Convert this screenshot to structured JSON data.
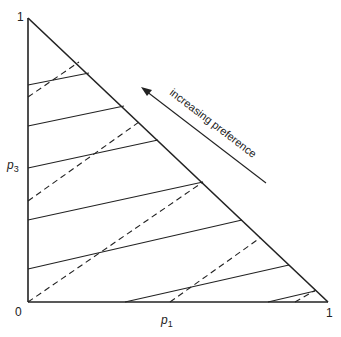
{
  "diagram": {
    "type": "probability-triangle",
    "vertices": {
      "top_label": "1",
      "origin_label": "0",
      "right_label": "1"
    },
    "axes": {
      "x_label": "p",
      "x_subscript": "1",
      "y_label": "p",
      "y_subscript": "3"
    },
    "annotation": "increasing preference",
    "solid_lines": "indifference curves (parallel, upward sloping)",
    "dashed_lines": "iso-expected-value lines (parallel, steeper)",
    "colors": {
      "line": "#222222",
      "background": "#ffffff"
    }
  }
}
